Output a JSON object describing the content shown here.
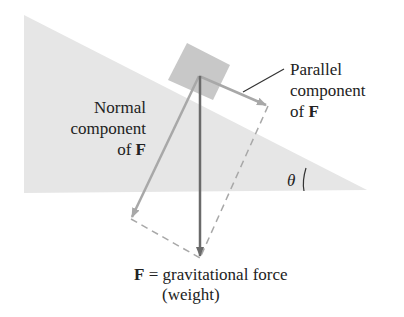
{
  "labels": {
    "normal_line1": "Normal",
    "normal_line2": "component",
    "normal_line3_prefix": "of ",
    "normal_line3_bold": "F",
    "parallel_line1": "Parallel",
    "parallel_line2": "component",
    "parallel_line3_prefix": "of ",
    "parallel_line3_bold": "F",
    "theta": "θ",
    "force_bold": "F",
    "force_rest": " = gravitational force",
    "weight": "(weight)"
  },
  "colors": {
    "incline": "#e6e6e6",
    "block": "#c8c8c8",
    "arrow_gray": "#a8a8a8",
    "arrow_dark": "#6a6a6a",
    "text": "#222222"
  }
}
